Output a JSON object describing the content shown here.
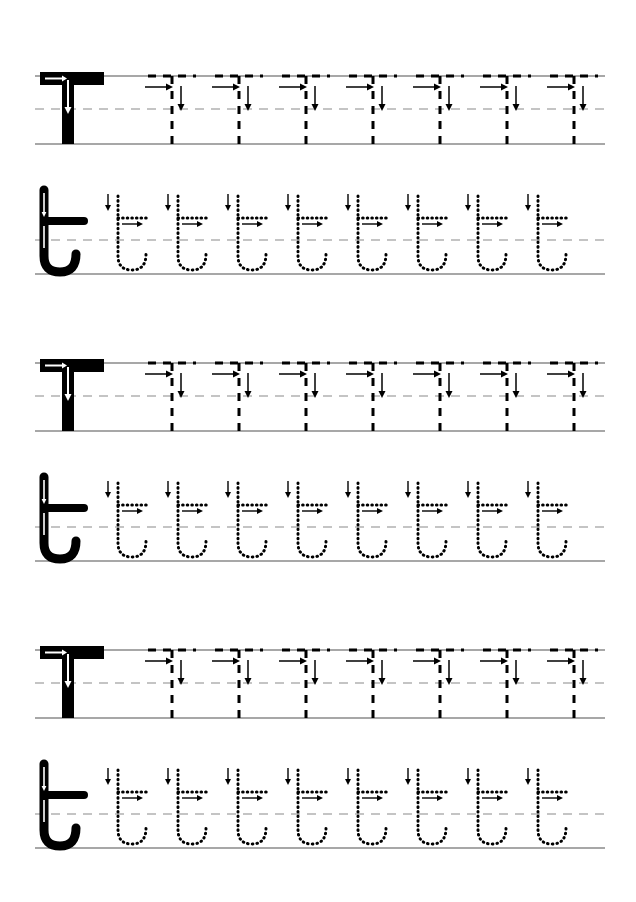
{
  "worksheet": {
    "title": "Letter T Handwriting Tracing Worksheet",
    "letter_uppercase": "T",
    "letter_lowercase": "t",
    "page_width": 636,
    "page_height": 902,
    "background_color": "#ffffff",
    "ink_color": "#000000",
    "guideline_color": "#8a8a8a",
    "block_count": 3,
    "blocks": [
      {
        "index": 1,
        "top": 60
      },
      {
        "index": 2,
        "top": 313
      },
      {
        "index": 3,
        "top": 600
      }
    ],
    "uppercase_row": {
      "name": "uppercase-T-row",
      "model_letter": "T",
      "model_style": "solid-filled",
      "tracing_count": 7,
      "tracing_style": "dashed-outline",
      "guidelines": {
        "top_line": "solid",
        "mid_line": "dashed",
        "base_line": "solid"
      },
      "strokes": [
        {
          "order": 1,
          "name": "crossbar",
          "direction": "left-to-right",
          "arrow": "right"
        },
        {
          "order": 2,
          "name": "stem",
          "direction": "top-to-bottom",
          "arrow": "down"
        }
      ]
    },
    "lowercase_row": {
      "name": "lowercase-t-row",
      "model_letter": "t",
      "model_style": "solid-filled",
      "tracing_count": 8,
      "tracing_style": "dotted-outline",
      "guidelines": {
        "top_line": "none",
        "mid_line": "dashed",
        "base_line": "solid"
      },
      "strokes": [
        {
          "order": 1,
          "name": "stem-with-hook",
          "direction": "top-to-bottom-curve-right",
          "arrow": "down"
        },
        {
          "order": 2,
          "name": "crossbar",
          "direction": "left-to-right",
          "arrow": "right"
        }
      ]
    },
    "layout": {
      "guide_left": 35,
      "guide_right": 605,
      "upper_row_height": 85,
      "lower_row_height": 95,
      "first_tracing_x": 148,
      "tracing_spacing_upper": 67,
      "tracing_spacing_lower": 60
    }
  }
}
